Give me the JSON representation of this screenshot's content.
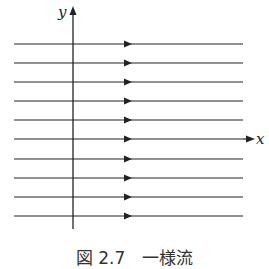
{
  "figure": {
    "axes": {
      "x_label": "x",
      "y_label": "y"
    },
    "streamlines": {
      "count": 10,
      "direction": "right",
      "y_positions": [
        44,
        63,
        82,
        101,
        120,
        139,
        159,
        178,
        197,
        216
      ],
      "x_start": 14,
      "x_end": 243,
      "arrow_x": 128
    },
    "caption": "図 2.7　一様流",
    "colors": {
      "line": "#222222",
      "background": "#ffffff"
    }
  }
}
